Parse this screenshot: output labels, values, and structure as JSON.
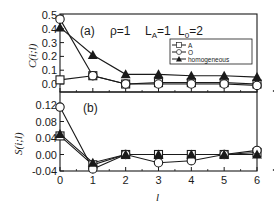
{
  "chart_data": [
    {
      "type": "line",
      "panel": "(a)",
      "title": "",
      "annotations": [
        "(a)",
        "ρ=1",
        "L_A=1 L_0=2"
      ],
      "xlabel": "",
      "ylabel": "C(i;l)",
      "x": [
        0,
        1,
        2,
        3,
        4,
        5,
        6
      ],
      "xlim": [
        0,
        6
      ],
      "ylim": [
        -0.03,
        0.5
      ],
      "yticks": [
        "0.0",
        "0.1",
        "0.2",
        "0.3",
        "0.4",
        "0.5"
      ],
      "grid": false,
      "legend_position": "upper right",
      "series": [
        {
          "name": "A",
          "marker": "open-square",
          "values": [
            0.03,
            0.06,
            0.0,
            0.01,
            0.01,
            0.01,
            0.0
          ]
        },
        {
          "name": "O",
          "marker": "open-circle",
          "values": [
            0.47,
            0.06,
            0.0,
            0.0,
            0.0,
            0.0,
            -0.01
          ]
        },
        {
          "name": "homogeneous",
          "marker": "filled-triangle",
          "values": [
            0.41,
            0.21,
            0.07,
            0.07,
            0.06,
            0.06,
            0.05
          ]
        }
      ]
    },
    {
      "type": "line",
      "panel": "(b)",
      "title": "",
      "annotations": [
        "(b)"
      ],
      "xlabel": "l",
      "ylabel": "S(i;l)",
      "x": [
        0,
        1,
        2,
        3,
        4,
        5,
        6
      ],
      "xticks": [
        "0",
        "1",
        "2",
        "3",
        "4",
        "5",
        "6"
      ],
      "xlim": [
        0,
        6
      ],
      "ylim": [
        -0.04,
        0.12
      ],
      "yticks": [
        "-0.04",
        "0.00",
        "0.04",
        "0.08",
        "0.12"
      ],
      "grid": false,
      "series": [
        {
          "name": "A",
          "marker": "open-square",
          "values": [
            0.045,
            -0.025,
            0.0,
            0.0,
            0.0,
            0.0,
            0.005
          ]
        },
        {
          "name": "O",
          "marker": "open-circle",
          "values": [
            0.115,
            -0.035,
            0.0,
            -0.02,
            -0.015,
            0.0,
            0.01
          ]
        },
        {
          "name": "homogeneous",
          "marker": "filled-triangle",
          "values": [
            0.05,
            -0.02,
            0.0,
            0.0,
            0.0,
            0.0,
            0.0
          ]
        }
      ]
    }
  ],
  "labels": {
    "panel_a": "(a)",
    "rho": "ρ=1",
    "la": "L",
    "la_sub": "A",
    "la_val": "=1",
    "l0": "L",
    "l0_sub": "0",
    "l0_val": "=2",
    "panel_b": "(b)",
    "ylabel_a": "C(i;l)",
    "ylabel_b": "S(i;l)",
    "xlabel": "l",
    "legend": [
      "A",
      "O",
      "homogeneous"
    ]
  },
  "colors": {
    "ink": "#1a1a1a",
    "background": "#ffffff"
  }
}
